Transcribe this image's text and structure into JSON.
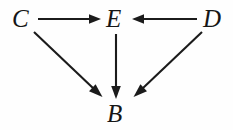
{
  "diagram": {
    "type": "directed-acyclic-graph",
    "title": "",
    "background_color": "#fefefe",
    "stroke_color": "#1b1b1b",
    "label_color": "#161616",
    "nodes": [
      {
        "id": "C",
        "label": "C",
        "x": 21,
        "y": 18,
        "font_size": 25
      },
      {
        "id": "E",
        "label": "E",
        "x": 115,
        "y": 18,
        "font_size": 25
      },
      {
        "id": "D",
        "label": "D",
        "x": 213,
        "y": 18,
        "font_size": 25
      },
      {
        "id": "B",
        "label": "B",
        "x": 116,
        "y": 113,
        "font_size": 25
      }
    ],
    "edges": [
      {
        "id": "C-E",
        "from": "C",
        "to": "E",
        "label": "",
        "x1": 38,
        "y1": 19,
        "x2": 101,
        "y2": 19
      },
      {
        "id": "D-E",
        "from": "D",
        "to": "E",
        "label": "",
        "x1": 197,
        "y1": 19,
        "x2": 132,
        "y2": 19
      },
      {
        "id": "E-B",
        "from": "E",
        "to": "B",
        "label": "",
        "x1": 116,
        "y1": 34,
        "x2": 116,
        "y2": 98
      },
      {
        "id": "C-B",
        "from": "C",
        "to": "B",
        "label": "",
        "x1": 34,
        "y1": 32,
        "x2": 102,
        "y2": 96
      },
      {
        "id": "D-B",
        "from": "D",
        "to": "B",
        "label": "",
        "x1": 202,
        "y1": 32,
        "x2": 134,
        "y2": 96
      }
    ]
  }
}
